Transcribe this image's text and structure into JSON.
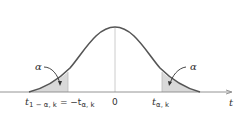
{
  "figure": {
    "x_axis_label": "t",
    "center_label": "0",
    "left_quantile_label": {
      "main": "t",
      "sub": "1 − α, k",
      "eq": "= −t",
      "eq_sub": "α, k"
    },
    "right_quantile_label": {
      "main": "t",
      "sub": "α, k"
    },
    "left_tail_label": "α",
    "right_tail_label": "α",
    "colors": {
      "curve": "#555555",
      "shade": "#d9d9d9",
      "axis": "#888888",
      "center_line": "#cccccc"
    }
  }
}
